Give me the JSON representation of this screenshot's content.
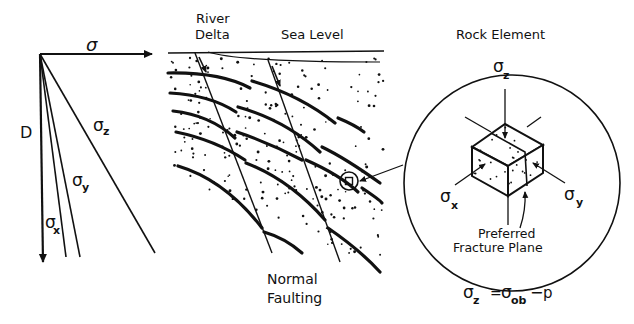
{
  "stress_plot": {
    "x_axis_label": "σ",
    "y_axis_label": "D",
    "curves": [
      {
        "name": "sigma-z",
        "symbol": "σ",
        "subscript": "z"
      },
      {
        "name": "sigma-y",
        "symbol": "σ",
        "subscript": "y"
      },
      {
        "name": "sigma-x",
        "symbol": "σ",
        "subscript": "x"
      }
    ]
  },
  "cross_section": {
    "label_river": "River",
    "label_delta": "Delta",
    "label_sea_level": "Sea Level",
    "caption_line1": "Normal",
    "caption_line2": "Faulting"
  },
  "rock_element": {
    "title": "Rock Element",
    "sigma_z": {
      "symbol": "σ",
      "subscript": "z"
    },
    "sigma_x": {
      "symbol": "σ",
      "subscript": "x"
    },
    "sigma_y": {
      "symbol": "σ",
      "subscript": "y"
    },
    "fracture_line1": "Preferred",
    "fracture_line2": "Fracture Plane"
  },
  "equation": {
    "lhs_symbol": "σ",
    "lhs_sub": "z",
    "equals": "=",
    "rhs_symbol": "σ",
    "rhs_sub": "ob",
    "minus": "−",
    "rhs_p": "p"
  }
}
